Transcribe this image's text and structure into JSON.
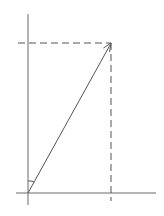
{
  "diagram": {
    "type": "vector-components",
    "background": "#ffffff",
    "stroke_color": "#555555",
    "axes": {
      "y_axis": {
        "x": 28,
        "y1": 14,
        "y2": 205
      },
      "x_axis": {
        "y": 193,
        "x1": 16,
        "x2": 156
      }
    },
    "vector": {
      "from": [
        28,
        193
      ],
      "to": [
        111,
        43
      ],
      "arrowhead": true
    },
    "projections": {
      "horizontal_dashed": {
        "y": 43,
        "x1": 18,
        "x2": 111
      },
      "vertical_dashed": {
        "x": 111,
        "y1": 43,
        "y2": 201
      }
    },
    "angle_marker": {
      "between": [
        "y-axis",
        "vector"
      ],
      "at": "origin"
    },
    "labels": []
  }
}
